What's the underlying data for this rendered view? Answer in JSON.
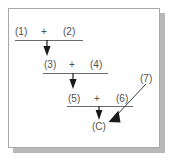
{
  "figure": {
    "frame": {
      "border_color": "#a8a8a8",
      "shadow_color": "#b9b9b9",
      "background": "#ffffff"
    },
    "ink_color": "#4f4f4f",
    "rule_color": "#6b6b6b",
    "arrow_color": "#1a1a1a"
  },
  "steps": [
    {
      "id": "step-1",
      "left_term": "(1)",
      "operator": "+",
      "right_term": "(2)",
      "result": "(3)"
    },
    {
      "id": "step-2",
      "left_term": "(3)",
      "operator": "+",
      "right_term": "(4)",
      "result": "(5)"
    },
    {
      "id": "step-3",
      "left_term": "(5)",
      "operator": "+",
      "right_term": "(6)",
      "result": "(C)"
    }
  ],
  "side_input": {
    "label": "(7)",
    "target": "(C)"
  },
  "final_product": "(C)"
}
